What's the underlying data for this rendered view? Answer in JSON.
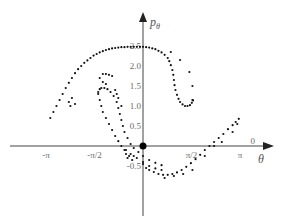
{
  "chart_data": {
    "type": "scatter",
    "title": "",
    "xlabel": "θ",
    "ylabel": "pθ",
    "ylabel_main": "p",
    "ylabel_sub": "θ",
    "xlim": [
      -4.1,
      4.1
    ],
    "ylim": [
      -2.0,
      3.3
    ],
    "grid": false,
    "legend": null,
    "x_ticks": [
      {
        "value": -3.1416,
        "label": "-π"
      },
      {
        "value": -1.5708,
        "label": "-π/2"
      },
      {
        "value": 1.5708,
        "label": "π/2"
      },
      {
        "value": 3.1416,
        "label": "π"
      }
    ],
    "extra_x_label": {
      "value": 3.55,
      "label": "0"
    },
    "y_ticks": [
      {
        "value": 2.5,
        "label": "2.5"
      },
      {
        "value": 2.0,
        "label": "2.0"
      },
      {
        "value": 1.5,
        "label": "1.5"
      },
      {
        "value": 1.0,
        "label": "1.0"
      },
      {
        "value": 0.5,
        "label": "0.5"
      },
      {
        "value": -0.5,
        "label": "-0.5"
      }
    ],
    "fixed_point": {
      "x": 0,
      "y": 0
    },
    "series": [
      {
        "name": "upper-arc",
        "points": [
          [
            -3.0,
            0.7
          ],
          [
            -2.9,
            0.85
          ],
          [
            -2.8,
            1.0
          ],
          [
            -2.7,
            1.15
          ],
          [
            -2.6,
            1.3
          ],
          [
            -2.5,
            1.45
          ],
          [
            -2.4,
            1.58
          ],
          [
            -2.3,
            1.7
          ],
          [
            -2.2,
            1.82
          ],
          [
            -2.1,
            1.92
          ],
          [
            -2.0,
            2.0
          ],
          [
            -1.9,
            2.08
          ],
          [
            -1.8,
            2.14
          ],
          [
            -1.7,
            2.2
          ],
          [
            -1.6,
            2.26
          ],
          [
            -1.5,
            2.3
          ],
          [
            -1.4,
            2.34
          ],
          [
            -1.3,
            2.37
          ],
          [
            -1.2,
            2.4
          ],
          [
            -1.1,
            2.42
          ],
          [
            -1.0,
            2.44
          ],
          [
            -0.9,
            2.45
          ],
          [
            -0.8,
            2.46
          ],
          [
            -0.7,
            2.47
          ],
          [
            -0.6,
            2.47
          ],
          [
            -0.5,
            2.48
          ],
          [
            -0.4,
            2.48
          ],
          [
            -0.3,
            2.48
          ],
          [
            -0.2,
            2.48
          ],
          [
            -0.1,
            2.48
          ],
          [
            0.0,
            2.48
          ],
          [
            0.1,
            2.47
          ],
          [
            0.2,
            2.46
          ],
          [
            0.3,
            2.44
          ],
          [
            0.4,
            2.42
          ],
          [
            0.5,
            2.38
          ],
          [
            0.6,
            2.34
          ],
          [
            0.7,
            2.28
          ],
          [
            0.8,
            2.2
          ],
          [
            0.85,
            2.12
          ],
          [
            0.9,
            2.02
          ],
          [
            0.95,
            1.9
          ],
          [
            0.98,
            1.78
          ],
          [
            1.0,
            1.65
          ],
          [
            1.02,
            1.52
          ],
          [
            1.05,
            1.4
          ],
          [
            1.1,
            1.28
          ],
          [
            1.15,
            1.18
          ],
          [
            1.2,
            1.1
          ],
          [
            1.28,
            1.04
          ],
          [
            1.36,
            1.0
          ],
          [
            1.44,
            1.0
          ],
          [
            1.52,
            1.02
          ],
          [
            1.58,
            1.08
          ],
          [
            1.62,
            1.14
          ]
        ]
      },
      {
        "name": "upper-scattered",
        "points": [
          [
            -2.4,
            1.1
          ],
          [
            -2.35,
            1.0
          ],
          [
            -2.3,
            1.2
          ],
          [
            -2.2,
            1.05
          ],
          [
            0.9,
            2.35
          ],
          [
            1.2,
            2.15
          ],
          [
            1.5,
            1.85
          ],
          [
            1.6,
            1.5
          ],
          [
            1.6,
            1.15
          ],
          [
            -1.4,
            1.7
          ],
          [
            -1.3,
            1.8
          ],
          [
            -1.2,
            1.8
          ],
          [
            -1.1,
            1.78
          ],
          [
            -1.0,
            1.75
          ],
          [
            -1.3,
            1.6
          ],
          [
            -1.2,
            1.55
          ]
        ]
      },
      {
        "name": "inner-loop-outer",
        "points": [
          [
            -1.45,
            1.35
          ],
          [
            -1.4,
            1.42
          ],
          [
            -1.35,
            1.45
          ],
          [
            -1.25,
            1.45
          ],
          [
            -1.15,
            1.42
          ],
          [
            -1.05,
            1.35
          ],
          [
            -0.95,
            1.25
          ],
          [
            -0.85,
            1.1
          ],
          [
            -0.8,
            0.95
          ],
          [
            -0.75,
            0.8
          ],
          [
            -0.7,
            0.65
          ],
          [
            -0.65,
            0.5
          ],
          [
            -0.6,
            0.35
          ],
          [
            -0.5,
            0.2
          ],
          [
            -0.4,
            0.05
          ],
          [
            -0.3,
            -0.05
          ],
          [
            -0.15,
            -0.15
          ],
          [
            0.0,
            -0.25
          ],
          [
            0.2,
            -0.35
          ],
          [
            0.4,
            -0.42
          ],
          [
            0.6,
            -0.48
          ]
        ]
      },
      {
        "name": "inner-loop-inner",
        "points": [
          [
            -1.45,
            1.3
          ],
          [
            -1.4,
            1.15
          ],
          [
            -1.35,
            1.0
          ],
          [
            -1.3,
            0.85
          ],
          [
            -1.2,
            0.7
          ],
          [
            -1.1,
            0.55
          ],
          [
            -1.0,
            0.4
          ],
          [
            -0.9,
            0.25
          ],
          [
            -0.8,
            0.12
          ],
          [
            -0.7,
            0.0
          ],
          [
            -0.55,
            -0.1
          ],
          [
            -0.4,
            -0.2
          ],
          [
            -0.2,
            -0.3
          ],
          [
            0.0,
            -0.4
          ],
          [
            0.2,
            -0.5
          ],
          [
            0.4,
            -0.56
          ],
          [
            0.6,
            -0.6
          ]
        ]
      },
      {
        "name": "inner-loop-dots",
        "points": [
          [
            -0.9,
            1.4
          ],
          [
            -0.85,
            1.3
          ],
          [
            -0.8,
            1.2
          ],
          [
            -0.7,
            1.0
          ],
          [
            -0.6,
            -0.1
          ],
          [
            -0.55,
            -0.2
          ],
          [
            -0.5,
            -0.3
          ],
          [
            -0.45,
            -0.25
          ],
          [
            -0.35,
            -0.35
          ],
          [
            -0.3,
            -0.25
          ]
        ]
      },
      {
        "name": "lower-arc",
        "points": [
          [
            0.0,
            -0.45
          ],
          [
            0.1,
            -0.55
          ],
          [
            0.2,
            -0.6
          ],
          [
            0.35,
            -0.65
          ],
          [
            0.5,
            -0.7
          ],
          [
            0.65,
            -0.72
          ],
          [
            0.8,
            -0.72
          ],
          [
            0.95,
            -0.7
          ],
          [
            1.1,
            -0.66
          ],
          [
            1.25,
            -0.6
          ],
          [
            1.4,
            -0.52
          ],
          [
            1.55,
            -0.43
          ],
          [
            1.7,
            -0.33
          ],
          [
            1.85,
            -0.22
          ],
          [
            2.0,
            -0.1
          ],
          [
            2.15,
            0.0
          ],
          [
            2.3,
            0.1
          ],
          [
            2.45,
            0.2
          ],
          [
            2.6,
            0.3
          ],
          [
            2.75,
            0.42
          ],
          [
            2.9,
            0.52
          ],
          [
            3.0,
            0.6
          ],
          [
            3.1,
            0.68
          ]
        ]
      },
      {
        "name": "lower-scattered",
        "points": [
          [
            0.7,
            -0.8
          ],
          [
            1.0,
            -0.75
          ],
          [
            1.3,
            -0.7
          ],
          [
            1.6,
            -0.6
          ],
          [
            2.0,
            -0.25
          ],
          [
            2.3,
            0.0
          ],
          [
            2.55,
            0.1
          ],
          [
            2.9,
            0.35
          ],
          [
            3.05,
            0.55
          ]
        ]
      }
    ]
  }
}
